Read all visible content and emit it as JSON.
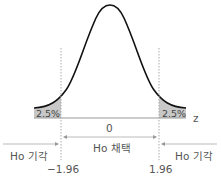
{
  "diagram": {
    "type": "normal-distribution-two-tailed-test",
    "curve_color": "#111111",
    "tail_fill_color": "#c8c8c8",
    "axis_color": "#888888",
    "guide_color": "#aaaaaa",
    "tails": {
      "left_percent": "2.5%",
      "right_percent": "2.5%"
    },
    "axis": {
      "variable_label": "z",
      "center_tick": "0",
      "left_critical": "−1.96",
      "right_critical": "1.96"
    },
    "regions": {
      "left_label": "Ho 기각",
      "center_label": "Ho 채택",
      "right_label": "Ho 기각"
    }
  }
}
